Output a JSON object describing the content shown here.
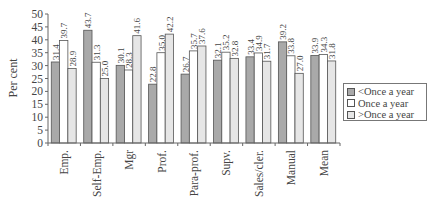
{
  "chart_data": {
    "type": "bar",
    "title": "",
    "xlabel": "",
    "ylabel": "Per cent",
    "ylim": [
      0,
      50
    ],
    "yticks": [
      0,
      5,
      10,
      15,
      20,
      25,
      30,
      35,
      40,
      45,
      50
    ],
    "grid": false,
    "legend_position": "right",
    "categories": [
      "Emp.",
      "Self-Emp.",
      "Mgr",
      "Prof.",
      "Para-prof.",
      "Supv.",
      "Sales/cler.",
      "Manual",
      "Mean"
    ],
    "series": [
      {
        "name": "<Once a year",
        "color": "#a9a9a9",
        "values": [
          31.4,
          43.7,
          30.1,
          22.8,
          26.7,
          32.1,
          33.4,
          39.2,
          33.9
        ]
      },
      {
        "name": "Once a year",
        "color": "#ffffff",
        "values": [
          39.7,
          31.3,
          28.3,
          35.0,
          35.7,
          35.2,
          34.9,
          33.8,
          34.3
        ]
      },
      {
        "name": ">Once a year",
        "color": "#e6e6e6",
        "values": [
          28.9,
          25.0,
          41.6,
          42.2,
          37.6,
          32.8,
          31.7,
          27.0,
          31.8
        ]
      }
    ]
  },
  "legend": {
    "items": [
      {
        "label": "<Once a year",
        "color": "#a9a9a9"
      },
      {
        "label": "Once a year",
        "color": "#ffffff"
      },
      {
        "label": ">Once a year",
        "color": "#e6e6e6"
      }
    ]
  }
}
